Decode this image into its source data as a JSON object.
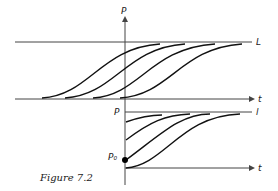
{
  "caption": "Figure 7.2",
  "top_panel": {
    "y_label": "P",
    "x_label": "t",
    "limit_label": "L"
  },
  "bottom_panel": {
    "y_label": "P",
    "x_label": "t",
    "limit_label": "l",
    "initial_label": "P₀"
  }
}
